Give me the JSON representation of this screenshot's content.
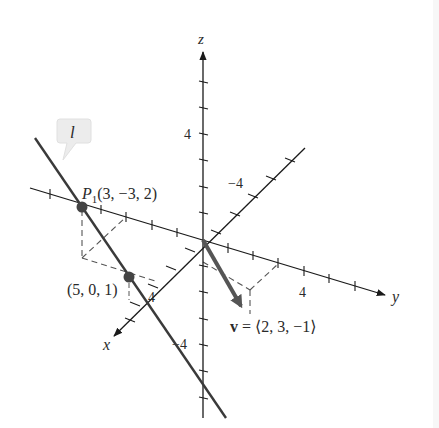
{
  "figure": {
    "axes": {
      "z_label": "z",
      "y_label": "y",
      "x_label": "x",
      "z_tick_pos": "4",
      "z_tick_neg": "−4",
      "y_tick": "4",
      "x_tick_neg": "−4",
      "x_tick_pos": "4"
    },
    "line": {
      "name": "l",
      "color": "#3a3a3a"
    },
    "points": [
      {
        "name": "P1",
        "label_prefix": "P",
        "label_sub": "1",
        "label_coords": "(3, −3, 2)",
        "coords": [
          3,
          -3,
          2
        ]
      },
      {
        "name": "Q",
        "label": "(5, 0, 1)",
        "coords": [
          5,
          0,
          1
        ]
      }
    ],
    "vector": {
      "name": "v",
      "label_bold": "v",
      "label_rest": " = ⟨2, 3, −1⟩",
      "components": [
        2,
        3,
        -1
      ],
      "color": "#555555"
    },
    "callout_color": "#eeeeee"
  }
}
